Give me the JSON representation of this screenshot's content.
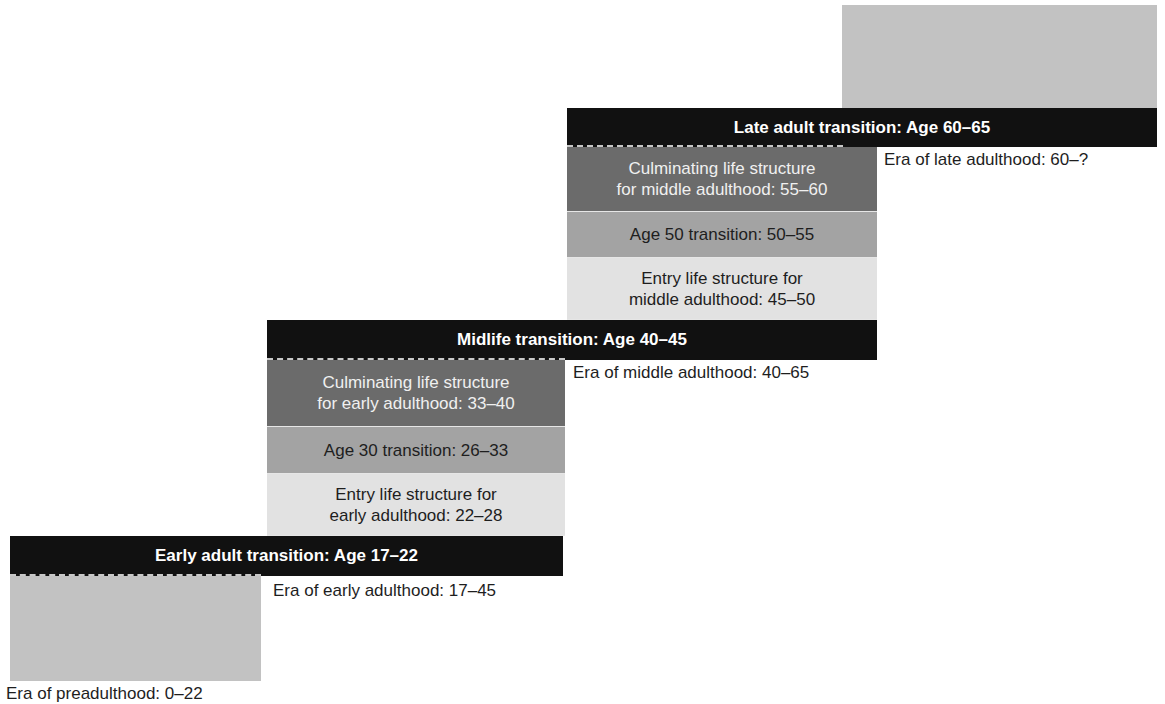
{
  "diagram": {
    "colors": {
      "transition_bar": "#111111",
      "culminating_box": "#6b6b6b",
      "age_transition_box": "#a3a3a3",
      "entry_box": "#e2e2e2",
      "era_block": "#c2c2c2"
    },
    "preadulthood": {
      "caption": "Era of preadulthood: 0–22"
    },
    "early": {
      "transition_bar": "Early adult transition: Age 17–22",
      "era_caption": "Era of early adulthood: 17–45",
      "entry_line1": "Entry life structure for",
      "entry_line2": "early adulthood: 22–28",
      "age_transition": "Age 30 transition: 26–33",
      "culminating_line1": "Culminating life structure",
      "culminating_line2": "for early adulthood: 33–40"
    },
    "middle": {
      "transition_bar": "Midlife transition: Age 40–45",
      "era_caption": "Era of middle adulthood: 40–65",
      "entry_line1": "Entry life structure for",
      "entry_line2": "middle adulthood: 45–50",
      "age_transition": "Age 50 transition: 50–55",
      "culminating_line1": "Culminating life structure",
      "culminating_line2": "for middle adulthood: 55–60"
    },
    "late": {
      "transition_bar": "Late adult transition: Age 60–65",
      "era_caption": "Era of late adulthood: 60–?"
    }
  }
}
